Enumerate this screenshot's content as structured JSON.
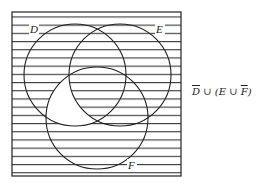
{
  "diagram": {
    "type": "venn",
    "sets": [
      {
        "name": "D",
        "label": "D",
        "cx": 75,
        "cy": 75,
        "r": 51
      },
      {
        "name": "E",
        "label": "E",
        "cx": 120,
        "cy": 75,
        "r": 51
      },
      {
        "name": "F",
        "label": "F",
        "cx": 97,
        "cy": 118,
        "r": 51
      }
    ],
    "universe": {
      "x": 12,
      "y": 12,
      "width": 169,
      "height": 164
    },
    "shading": "horizontal-lines",
    "unshaded_region": "D ∩ F ∩ not E",
    "formula": {
      "d": "D",
      "union1": " ∪ (",
      "e": "E",
      "union2": " ∪ ",
      "f": "F",
      "close": ")"
    },
    "line_color": "#222222",
    "background": "#ffffff"
  }
}
